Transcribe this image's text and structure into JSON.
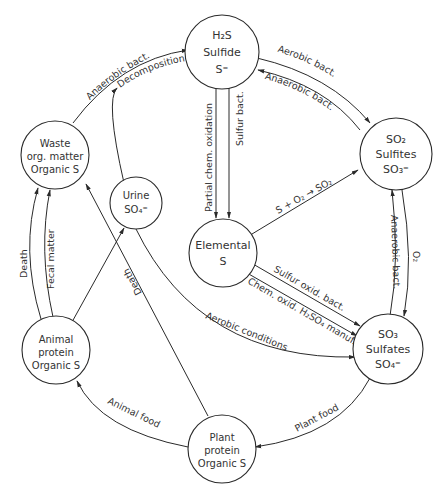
{
  "colors": {
    "line": "#2a2a2a",
    "text": "#333333",
    "background": "#ffffff"
  },
  "nodes": {
    "sulfide": {
      "line1": "H₂S",
      "line2": "Sulfide",
      "line3": "S⁼"
    },
    "sulfites": {
      "line1": "SO₂",
      "line2": "Sulfites",
      "line3": "SO₃⁼"
    },
    "sulfates": {
      "line1": "SO₃",
      "line2": "Sulfates",
      "line3": "SO₄⁼"
    },
    "elemental": {
      "line1": "Elemental",
      "line2": "S"
    },
    "urine": {
      "line1": "Urine",
      "line2": "SO₄⁼"
    },
    "waste": {
      "line1": "Waste",
      "line2": "org. matter",
      "line3": "Organic S"
    },
    "animal": {
      "line1": "Animal",
      "line2": "protein",
      "line3": "Organic S"
    },
    "plant": {
      "line1": "Plant",
      "line2": "protein",
      "line3": "Organic S"
    }
  },
  "edges": {
    "aerobic_bact": "Aerobic bact.",
    "anaerobic_bact_top": "Anaerobic bact.",
    "anaerobic_bact_left": "Anaerobic bact.",
    "decomposition": "Decomposition",
    "partial_chem_oxidation": "Partial chem. oxidation",
    "sulfur_bact": "Sulfur bact.",
    "s_o2_so2": "S + O₂ → SO₂",
    "anaerobic_bact_right": "Anaerobic bact.",
    "o2": "O₂",
    "sulfur_oxid_bact": "Sulfur oxid. bact.",
    "chem_oxid": "Chem. oxid. H₂SO₄ manuf.",
    "aerobic_conditions": "Aerobic conditions",
    "death_left": "Death",
    "fecal_matter": "Fecal matter",
    "death_plant": "Death",
    "animal_food": "Animal food",
    "plant_food": "Plant food"
  }
}
